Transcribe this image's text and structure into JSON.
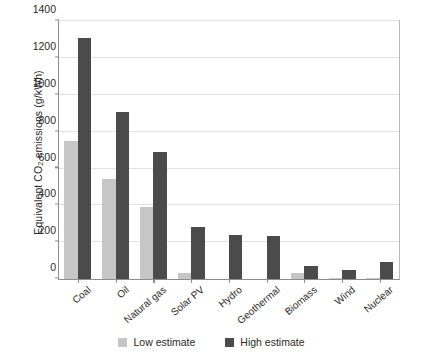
{
  "chart_data": {
    "type": "bar",
    "title": "",
    "xlabel": "",
    "ylabel": "Equivalent CO2 emissions (g/kWh)",
    "ylabel_prefix": "Equivalent CO",
    "ylabel_sub": "2",
    "ylabel_suffix": " emissions (g/kWh)",
    "ylim": [
      0,
      1400
    ],
    "yticks": [
      0,
      200,
      400,
      600,
      800,
      1000,
      1200,
      1400
    ],
    "ytick_labels": [
      "0",
      "200",
      "400",
      "600",
      "800",
      "1000",
      "1200",
      "1400"
    ],
    "grid": true,
    "grid_axis": "y",
    "legend_position": "bottom-center",
    "categories": [
      "Coal",
      "Oil",
      "Natural gas",
      "Solar PV",
      "Hydro",
      "Geothermal",
      "Biomass",
      "Wind",
      "Nuclear"
    ],
    "series": [
      {
        "name": "Low estimate",
        "color": "#c6c6c6",
        "values": [
          750,
          545,
          390,
          30,
          0,
          0,
          30,
          8,
          5
        ]
      },
      {
        "name": "High estimate",
        "color": "#4b4b4b",
        "values": [
          1310,
          905,
          690,
          280,
          240,
          235,
          70,
          50,
          90
        ]
      }
    ]
  },
  "legend": {
    "items": [
      {
        "label": "Low estimate",
        "color": "#c6c6c6",
        "swatch_name": "legend-swatch-low"
      },
      {
        "label": "High estimate",
        "color": "#4b4b4b",
        "swatch_name": "legend-swatch-high"
      }
    ]
  },
  "colors": {
    "low_estimate": "#c6c6c6",
    "high_estimate": "#4b4b4b",
    "axis": "#8d8d8d",
    "grid": "#e2e2e2",
    "text": "#2b2726",
    "background": "#ffffff"
  }
}
